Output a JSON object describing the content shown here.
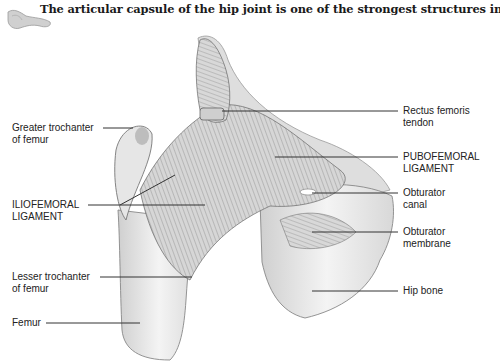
{
  "caption": "The articular capsule of the hip joint is one of the strongest structures in the body.",
  "thumbnail_icon": "hip-bone-thumbnail-icon",
  "labels": {
    "greater_trochanter": {
      "line1": "Greater trochanter",
      "line2": "of femur"
    },
    "iliofemoral": {
      "line1": "ILIOFEMORAL",
      "line2": "LIGAMENT"
    },
    "lesser_trochanter": {
      "line1": "Lesser trochanter",
      "line2": "of femur"
    },
    "femur": {
      "line1": "Femur"
    },
    "rectus_femoris": {
      "line1": "Rectus femoris",
      "line2": "tendon"
    },
    "pubofemoral": {
      "line1": "PUBOFEMORAL",
      "line2": "LIGAMENT"
    },
    "obturator_canal": {
      "line1": "Obturator",
      "line2": "canal"
    },
    "obturator_membrane": {
      "line1": "Obturator",
      "line2": "membrane"
    },
    "hip_bone": {
      "line1": "Hip bone"
    }
  },
  "colors": {
    "line": "#333333",
    "text": "#222222",
    "bone": "#e8e8e8",
    "ligament": "#bdbdbd"
  }
}
